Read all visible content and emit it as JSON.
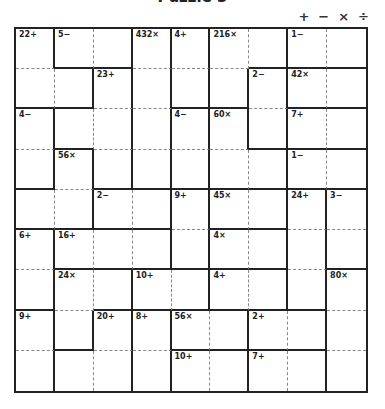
{
  "title": "Puzzle 3",
  "operators": [
    {
      "name": "plus",
      "symbol": "+"
    },
    {
      "name": "minus",
      "symbol": "−"
    },
    {
      "name": "times",
      "symbol": "×"
    },
    {
      "name": "divide",
      "symbol": "÷"
    }
  ],
  "grid": {
    "size": 9,
    "colors": {
      "solid": "#222222",
      "dashed": "#888888",
      "background": "#ffffff"
    },
    "cages": [
      {
        "label": "22+",
        "cells": [
          [
            0,
            0
          ],
          [
            1,
            0
          ],
          [
            1,
            1
          ]
        ]
      },
      {
        "label": "5−",
        "cells": [
          [
            0,
            1
          ],
          [
            0,
            2
          ]
        ]
      },
      {
        "label": "432×",
        "cells": [
          [
            0,
            3
          ],
          [
            1,
            3
          ],
          [
            2,
            3
          ],
          [
            3,
            3
          ]
        ]
      },
      {
        "label": "4+",
        "cells": [
          [
            0,
            4
          ],
          [
            1,
            4
          ]
        ]
      },
      {
        "label": "216×",
        "cells": [
          [
            0,
            5
          ],
          [
            0,
            6
          ],
          [
            1,
            5
          ]
        ]
      },
      {
        "label": "1−",
        "cells": [
          [
            0,
            7
          ],
          [
            0,
            8
          ]
        ]
      },
      {
        "label": "23+",
        "cells": [
          [
            1,
            2
          ],
          [
            2,
            1
          ],
          [
            2,
            2
          ],
          [
            3,
            2
          ]
        ]
      },
      {
        "label": "2−",
        "cells": [
          [
            1,
            6
          ],
          [
            2,
            6
          ]
        ]
      },
      {
        "label": "42×",
        "cells": [
          [
            1,
            7
          ],
          [
            1,
            8
          ]
        ]
      },
      {
        "label": "4−",
        "cells": [
          [
            2,
            0
          ],
          [
            3,
            0
          ]
        ]
      },
      {
        "label": "4−",
        "cells": [
          [
            2,
            4
          ],
          [
            3,
            4
          ]
        ]
      },
      {
        "label": "60×",
        "cells": [
          [
            2,
            5
          ],
          [
            3,
            5
          ],
          [
            3,
            6
          ]
        ]
      },
      {
        "label": "7+",
        "cells": [
          [
            2,
            7
          ],
          [
            2,
            8
          ]
        ]
      },
      {
        "label": "56×",
        "cells": [
          [
            3,
            1
          ],
          [
            4,
            0
          ],
          [
            4,
            1
          ]
        ]
      },
      {
        "label": "1−",
        "cells": [
          [
            3,
            7
          ],
          [
            3,
            8
          ]
        ]
      },
      {
        "label": "2−",
        "cells": [
          [
            4,
            2
          ],
          [
            4,
            3
          ]
        ]
      },
      {
        "label": "9+",
        "cells": [
          [
            4,
            4
          ],
          [
            5,
            4
          ]
        ]
      },
      {
        "label": "45×",
        "cells": [
          [
            4,
            5
          ],
          [
            4,
            6
          ]
        ]
      },
      {
        "label": "24+",
        "cells": [
          [
            4,
            7
          ],
          [
            5,
            7
          ],
          [
            6,
            7
          ]
        ]
      },
      {
        "label": "3−",
        "cells": [
          [
            4,
            8
          ],
          [
            5,
            8
          ]
        ]
      },
      {
        "label": "6+",
        "cells": [
          [
            5,
            0
          ],
          [
            6,
            0
          ]
        ]
      },
      {
        "label": "16+",
        "cells": [
          [
            5,
            1
          ],
          [
            5,
            2
          ],
          [
            5,
            3
          ]
        ]
      },
      {
        "label": "4×",
        "cells": [
          [
            5,
            5
          ],
          [
            5,
            6
          ]
        ]
      },
      {
        "label": "24×",
        "cells": [
          [
            6,
            1
          ],
          [
            6,
            2
          ],
          [
            7,
            1
          ]
        ]
      },
      {
        "label": "10+",
        "cells": [
          [
            6,
            3
          ],
          [
            6,
            4
          ]
        ]
      },
      {
        "label": "4+",
        "cells": [
          [
            6,
            5
          ],
          [
            6,
            6
          ]
        ]
      },
      {
        "label": "80×",
        "cells": [
          [
            6,
            8
          ],
          [
            7,
            8
          ],
          [
            8,
            8
          ]
        ]
      },
      {
        "label": "9+",
        "cells": [
          [
            7,
            0
          ],
          [
            8,
            0
          ]
        ]
      },
      {
        "label": "20+",
        "cells": [
          [
            7,
            2
          ],
          [
            8,
            1
          ],
          [
            8,
            2
          ]
        ]
      },
      {
        "label": "8+",
        "cells": [
          [
            7,
            3
          ],
          [
            8,
            3
          ]
        ]
      },
      {
        "label": "56×",
        "cells": [
          [
            7,
            4
          ],
          [
            7,
            5
          ]
        ]
      },
      {
        "label": "2+",
        "cells": [
          [
            7,
            6
          ],
          [
            7,
            7
          ]
        ]
      },
      {
        "label": "10+",
        "cells": [
          [
            8,
            4
          ],
          [
            8,
            5
          ]
        ]
      },
      {
        "label": "7+",
        "cells": [
          [
            8,
            6
          ],
          [
            8,
            7
          ]
        ]
      }
    ],
    "values": []
  }
}
